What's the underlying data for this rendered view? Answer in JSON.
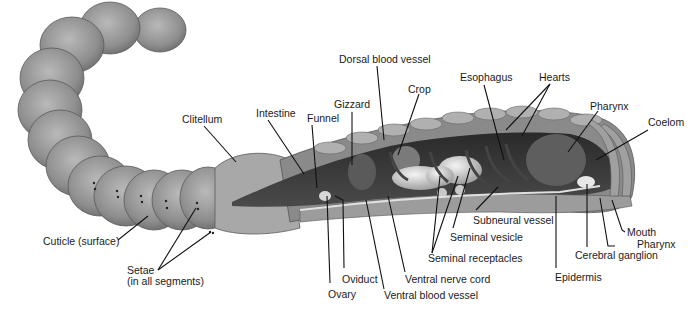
{
  "labels": {
    "dorsal_blood_vessel": "Dorsal blood vessel",
    "esophagus": "Esophagus",
    "hearts": "Hearts",
    "crop": "Crop",
    "gizzard": "Gizzard",
    "pharynx_top": "Pharynx",
    "coelom": "Coelom",
    "clitellum": "Clitellum",
    "intestine": "Intestine",
    "funnel": "Funnel",
    "cuticle": "Cuticle (surface)",
    "setae_line1": "Setae",
    "setae_line2": "(in all segments)",
    "ovary": "Ovary",
    "oviduct": "Oviduct",
    "ventral_blood_vessel": "Ventral blood vessel",
    "ventral_nerve_cord": "Ventral nerve cord",
    "seminal_receptacles": "Seminal receptacles",
    "seminal_vesicle": "Seminal vesicle",
    "subneural_vessel": "Subneural vessel",
    "epidermis": "Epidermis",
    "cerebral_ganglion": "Cerebral ganglion",
    "pharynx_bottom": "Pharynx",
    "mouth": "Mouth"
  }
}
